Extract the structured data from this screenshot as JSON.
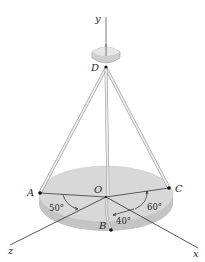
{
  "figure": {
    "type": "3D statics diagram",
    "labels": {
      "y_axis": "y",
      "x_axis": "x",
      "z_axis": "z",
      "point_D": "D",
      "point_O": "O",
      "point_A": "A",
      "point_B": "B",
      "point_C": "C"
    },
    "angles": {
      "angle_A": "50°",
      "angle_B": "40°",
      "angle_C": "60°"
    },
    "colors": {
      "plate_top": "#d6d6d6",
      "plate_edge": "#bdbdbd",
      "cable": "#e0e0e0",
      "cable_outline": "#9a9a9a",
      "lines": "#3a3a3a",
      "points": "#111111"
    }
  }
}
